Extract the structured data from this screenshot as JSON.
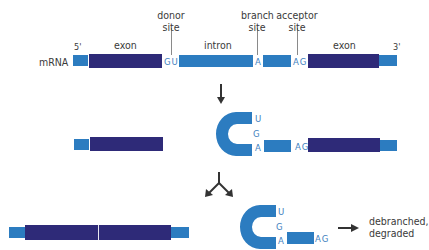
{
  "colors": {
    "exon": "#2e2a78",
    "intron_utr": "#2c7cc0",
    "nucleotide_text": "#3f7fc0",
    "label_text": "#3a3a3a",
    "arrow": "#333333"
  },
  "row1": {
    "molecule_label": "mRNA",
    "five_prime": "5'",
    "three_prime": "3'",
    "exon1_label": "exon",
    "intron_label": "intron",
    "exon2_label": "exon",
    "donor_site": {
      "line1": "donor",
      "line2": "site",
      "seq": "GU"
    },
    "branch_site": {
      "line1": "branch",
      "line2": "site",
      "seq": "A"
    },
    "acceptor_site": {
      "line1": "acceptor",
      "line2": "site",
      "seq": "AG"
    }
  },
  "row2": {
    "lariat_letters": [
      "U",
      "G",
      "A"
    ],
    "acceptor_seq": "AG"
  },
  "row3": {
    "lariat_letters": [
      "U",
      "G",
      "A"
    ],
    "acceptor_seq": "AG",
    "fate_line1": "debranched,",
    "fate_line2": "degraded"
  },
  "icons": [
    "down-arrow-icon",
    "split-arrow-icon",
    "right-arrow-icon"
  ]
}
